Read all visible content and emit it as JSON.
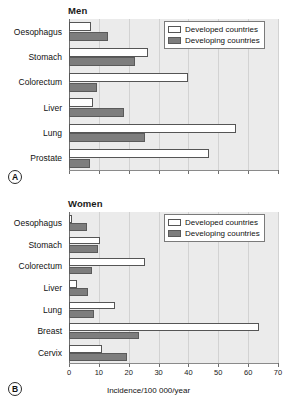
{
  "figure": {
    "axis_title": "Incidence/100 000/year",
    "legend": {
      "developed_label": "Developed countries",
      "developing_label": "Developing countries",
      "developed_color": "#ffffff",
      "developing_color": "#7d7d7d"
    },
    "panels": [
      {
        "tag": "A",
        "title": "Men"
      },
      {
        "tag": "B",
        "title": "Women"
      }
    ]
  },
  "chart_data": [
    {
      "type": "bar",
      "orientation": "horizontal",
      "title": "Men",
      "panel_tag": "A",
      "xlabel": "Incidence/100 000/year",
      "ylabel": "",
      "xlim": [
        0,
        70
      ],
      "xticks": [
        0,
        10,
        20,
        30,
        40,
        50,
        60,
        70
      ],
      "grid": true,
      "legend_position": "top-right",
      "categories": [
        "Oesophagus",
        "Stomach",
        "Colorectum",
        "Liver",
        "Lung",
        "Prostate"
      ],
      "series": [
        {
          "name": "Developed countries",
          "values": [
            7.5,
            26.5,
            40.0,
            8.0,
            56.0,
            47.0
          ]
        },
        {
          "name": "Developing countries",
          "values": [
            13.0,
            22.0,
            9.5,
            18.5,
            25.5,
            7.0
          ]
        }
      ]
    },
    {
      "type": "bar",
      "orientation": "horizontal",
      "title": "Women",
      "panel_tag": "B",
      "xlabel": "Incidence/100 000/year",
      "ylabel": "",
      "xlim": [
        0,
        70
      ],
      "xticks": [
        0,
        10,
        20,
        30,
        40,
        50,
        60,
        70
      ],
      "grid": true,
      "legend_position": "top-right",
      "categories": [
        "Oesophagus",
        "Stomach",
        "Colorectum",
        "Liver",
        "Lung",
        "Breast",
        "Cervix"
      ],
      "series": [
        {
          "name": "Developed countries",
          "values": [
            1.0,
            10.5,
            25.5,
            2.8,
            15.5,
            63.5,
            11.0
          ]
        },
        {
          "name": "Developing countries",
          "values": [
            6.0,
            9.8,
            7.8,
            6.5,
            8.5,
            23.5,
            19.5
          ]
        }
      ]
    }
  ]
}
